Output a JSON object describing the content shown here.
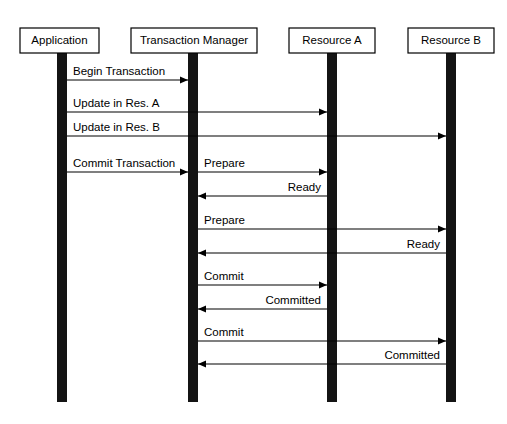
{
  "diagram": {
    "type": "sequence-diagram",
    "background_color": "#ffffff",
    "line_color": "#000000",
    "lifeline_color": "#141414",
    "participants": [
      {
        "id": "application",
        "label": "Application",
        "x": 62,
        "box_x": 20,
        "box_y": 28,
        "box_w": 79,
        "box_h": 25
      },
      {
        "id": "transaction-manager",
        "label": "Transaction Manager",
        "x": 193,
        "box_x": 131,
        "box_y": 28,
        "box_w": 126,
        "box_h": 25
      },
      {
        "id": "resource-a",
        "label": "Resource A",
        "x": 332,
        "box_x": 289,
        "box_y": 28,
        "box_w": 86,
        "box_h": 25
      },
      {
        "id": "resource-b",
        "label": "Resource B",
        "x": 451,
        "box_x": 408,
        "box_y": 28,
        "box_w": 86,
        "box_h": 25
      }
    ],
    "lifeline": {
      "top": 53,
      "bottom": 402,
      "width": 10
    },
    "messages": [
      {
        "id": "begin-transaction",
        "label": "Begin Transaction",
        "from": "application",
        "to": "transaction-manager",
        "direction": "right",
        "y": 80
      },
      {
        "id": "update-in-res-a",
        "label": "Update in Res. A",
        "from": "application",
        "to": "resource-a",
        "direction": "right",
        "y": 112
      },
      {
        "id": "update-in-res-b",
        "label": "Update in Res. B",
        "from": "application",
        "to": "resource-b",
        "direction": "right",
        "y": 136
      },
      {
        "id": "commit-transaction",
        "label": "Commit Transaction",
        "from": "application",
        "to": "transaction-manager",
        "direction": "right",
        "y": 172
      },
      {
        "id": "prepare-a",
        "label": "Prepare",
        "from": "transaction-manager",
        "to": "resource-a",
        "direction": "right",
        "y": 172
      },
      {
        "id": "ready-a",
        "label": "Ready",
        "from": "resource-a",
        "to": "transaction-manager",
        "direction": "left",
        "y": 196
      },
      {
        "id": "prepare-b",
        "label": "Prepare",
        "from": "transaction-manager",
        "to": "resource-b",
        "direction": "right",
        "y": 229
      },
      {
        "id": "ready-b",
        "label": "Ready",
        "from": "resource-b",
        "to": "transaction-manager",
        "direction": "left",
        "y": 253
      },
      {
        "id": "commit-a",
        "label": "Commit",
        "from": "transaction-manager",
        "to": "resource-a",
        "direction": "right",
        "y": 285
      },
      {
        "id": "committed-a",
        "label": "Committed",
        "from": "resource-a",
        "to": "transaction-manager",
        "direction": "left",
        "y": 309
      },
      {
        "id": "commit-b",
        "label": "Commit",
        "from": "transaction-manager",
        "to": "resource-b",
        "direction": "right",
        "y": 341
      },
      {
        "id": "committed-b",
        "label": "Committed",
        "from": "resource-b",
        "to": "transaction-manager",
        "direction": "left",
        "y": 364
      }
    ]
  }
}
